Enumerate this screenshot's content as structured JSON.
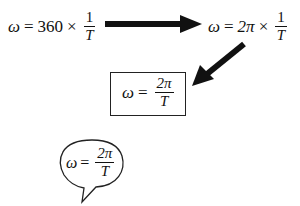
{
  "diagram": {
    "eq1": {
      "lhs": "ω",
      "eq": "=",
      "coef": "360",
      "times": "×",
      "num": "1",
      "den": "T"
    },
    "eq2": {
      "lhs": "ω",
      "eq": "=",
      "coef": "2π",
      "times": "×",
      "num": "1",
      "den": "T"
    },
    "eq3": {
      "lhs": "ω",
      "eq": "=",
      "num": "2π",
      "den": "T"
    },
    "eq4": {
      "lhs": "ω",
      "eq": "=",
      "num": "2π",
      "den": "T"
    },
    "colors": {
      "ink": "#111111",
      "background": "#ffffff"
    }
  }
}
